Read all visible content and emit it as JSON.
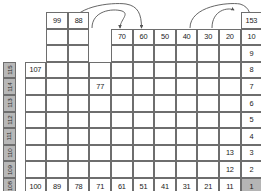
{
  "diagram": {
    "cell_w": 21.6,
    "cell_h": 16.6,
    "origin_x": 3,
    "origin_y": 12,
    "colors": {
      "grid_line": "#6e6e6e",
      "cell_fill": "#ffffff",
      "highlight_gray": "#b5b5b5",
      "highlight_black": "#151515",
      "side_label_fill": "#b8b8b8",
      "arrow": "#555555"
    }
  },
  "cells": [
    {
      "name": "cell-99",
      "col": 2,
      "row": 0,
      "text": "99",
      "fill": "white"
    },
    {
      "name": "cell-88",
      "col": 3,
      "row": 0,
      "text": "88",
      "fill": "white"
    },
    {
      "name": "cell-153",
      "col": 11,
      "row": 0,
      "text": "153",
      "fill": "white"
    },
    {
      "name": "cell-142",
      "col": 12,
      "row": 0,
      "text": "142",
      "fill": "white"
    },
    {
      "name": "cell-blank-c2r1",
      "col": 2,
      "row": 1,
      "text": "",
      "fill": "white"
    },
    {
      "name": "cell-blank-c3r1",
      "col": 3,
      "row": 1,
      "text": "",
      "fill": "white"
    },
    {
      "name": "cell-70",
      "col": 5,
      "row": 1,
      "text": "70",
      "fill": "white"
    },
    {
      "name": "cell-60",
      "col": 6,
      "row": 1,
      "text": "60",
      "fill": "white"
    },
    {
      "name": "cell-50",
      "col": 7,
      "row": 1,
      "text": "50",
      "fill": "white"
    },
    {
      "name": "cell-40",
      "col": 8,
      "row": 1,
      "text": "40",
      "fill": "white"
    },
    {
      "name": "cell-30",
      "col": 9,
      "row": 1,
      "text": "30",
      "fill": "white"
    },
    {
      "name": "cell-20",
      "col": 10,
      "row": 1,
      "text": "20",
      "fill": "white"
    },
    {
      "name": "cell-10",
      "col": 11,
      "row": 1,
      "text": "10",
      "fill": "white"
    },
    {
      "name": "cell-blank-c11r1",
      "col": 11,
      "row": 0,
      "text": "",
      "fill": "none"
    },
    {
      "name": "cell-blank-c12r1",
      "col": 12,
      "row": 1,
      "text": "",
      "fill": "white"
    },
    {
      "name": "cell-blank-c13r1",
      "col": 13,
      "row": 1,
      "text": "",
      "fill": "white"
    },
    {
      "name": "cell-blank-c2r2",
      "col": 2,
      "row": 2,
      "text": "",
      "fill": "white"
    },
    {
      "name": "cell-blank-c3r2",
      "col": 3,
      "row": 2,
      "text": "",
      "fill": "white"
    },
    {
      "name": "cell-blank-c5r2",
      "col": 5,
      "row": 2,
      "text": "",
      "fill": "white"
    },
    {
      "name": "cell-blank-c6r2",
      "col": 6,
      "row": 2,
      "text": "",
      "fill": "white"
    },
    {
      "name": "cell-blank-c7r2",
      "col": 7,
      "row": 2,
      "text": "",
      "fill": "white"
    },
    {
      "name": "cell-blank-c8r2",
      "col": 8,
      "row": 2,
      "text": "",
      "fill": "white"
    },
    {
      "name": "cell-blank-c9r2",
      "col": 9,
      "row": 2,
      "text": "",
      "fill": "white"
    },
    {
      "name": "cell-blank-c10r2",
      "col": 10,
      "row": 2,
      "text": "",
      "fill": "white"
    },
    {
      "name": "cell-9",
      "col": 11,
      "row": 2,
      "text": "9",
      "fill": "white"
    },
    {
      "name": "cell-blank-c12r2",
      "col": 12,
      "row": 2,
      "text": "",
      "fill": "white"
    },
    {
      "name": "cell-blank-c13r2",
      "col": 13,
      "row": 2,
      "text": "",
      "fill": "white"
    },
    {
      "name": "cell-107",
      "col": 1,
      "row": 3,
      "text": "107",
      "fill": "white"
    },
    {
      "name": "cell-8",
      "col": 11,
      "row": 3,
      "text": "8",
      "fill": "white"
    },
    {
      "name": "cell-131",
      "col": 14,
      "row": 3,
      "text": "131",
      "fill": "white"
    },
    {
      "name": "cell-77",
      "col": 4,
      "row": 4,
      "text": "77",
      "fill": "white"
    },
    {
      "name": "cell-7",
      "col": 11,
      "row": 4,
      "text": "7",
      "fill": "white"
    },
    {
      "name": "cell-black-c12r4",
      "col": 12,
      "row": 4,
      "text": "",
      "fill": "black"
    },
    {
      "name": "cell-6",
      "col": 11,
      "row": 5,
      "text": "6",
      "fill": "white"
    },
    {
      "name": "cell-159",
      "col": 12,
      "row": 5,
      "text": "159",
      "fill": "white"
    },
    {
      "name": "cell-5",
      "col": 11,
      "row": 6,
      "text": "5",
      "fill": "white"
    },
    {
      "name": "cell-158",
      "col": 12,
      "row": 6,
      "text": "158",
      "fill": "white"
    },
    {
      "name": "cell-4",
      "col": 11,
      "row": 7,
      "text": "4",
      "fill": "white"
    },
    {
      "name": "cell-157",
      "col": 12,
      "row": 7,
      "text": "157",
      "fill": "white"
    },
    {
      "name": "cell-13",
      "col": 10,
      "row": 8,
      "text": "13",
      "fill": "white"
    },
    {
      "name": "cell-3",
      "col": 11,
      "row": 8,
      "text": "3",
      "fill": "white"
    },
    {
      "name": "cell-156",
      "col": 12,
      "row": 8,
      "text": "156",
      "fill": "white"
    },
    {
      "name": "cell-12",
      "col": 10,
      "row": 9,
      "text": "12",
      "fill": "white"
    },
    {
      "name": "cell-2",
      "col": 11,
      "row": 9,
      "text": "2",
      "fill": "white"
    },
    {
      "name": "cell-155",
      "col": 12,
      "row": 9,
      "text": "155",
      "fill": "white"
    },
    {
      "name": "cell-144",
      "col": 13,
      "row": 9,
      "text": "144",
      "fill": "white"
    },
    {
      "name": "cell-133",
      "col": 14,
      "row": 9,
      "text": "133",
      "fill": "white"
    },
    {
      "name": "cell-125",
      "col": 15,
      "row": 9,
      "text": "125",
      "fill": "white"
    },
    {
      "name": "cell-100",
      "col": 1,
      "row": 10,
      "text": "100",
      "fill": "white"
    },
    {
      "name": "cell-89",
      "col": 2,
      "row": 10,
      "text": "89",
      "fill": "white"
    },
    {
      "name": "cell-78",
      "col": 3,
      "row": 10,
      "text": "78",
      "fill": "white"
    },
    {
      "name": "cell-71",
      "col": 4,
      "row": 10,
      "text": "71",
      "fill": "white"
    },
    {
      "name": "cell-61",
      "col": 5,
      "row": 10,
      "text": "61",
      "fill": "white"
    },
    {
      "name": "cell-51",
      "col": 6,
      "row": 10,
      "text": "51",
      "fill": "white"
    },
    {
      "name": "cell-41",
      "col": 7,
      "row": 10,
      "text": "41",
      "fill": "white"
    },
    {
      "name": "cell-31",
      "col": 8,
      "row": 10,
      "text": "31",
      "fill": "white"
    },
    {
      "name": "cell-21",
      "col": 9,
      "row": 10,
      "text": "21",
      "fill": "white"
    },
    {
      "name": "cell-11",
      "col": 10,
      "row": 10,
      "text": "11",
      "fill": "white"
    },
    {
      "name": "cell-1",
      "col": 11,
      "row": 10,
      "text": "1",
      "fill": "gray"
    },
    {
      "name": "cell-154",
      "col": 12,
      "row": 10,
      "text": "154",
      "fill": "white"
    },
    {
      "name": "cell-143",
      "col": 13,
      "row": 10,
      "text": "143",
      "fill": "white"
    },
    {
      "name": "cell-132",
      "col": 14,
      "row": 10,
      "text": "132",
      "fill": "white"
    },
    {
      "name": "cell-124",
      "col": 15,
      "row": 10,
      "text": "124",
      "fill": "white"
    }
  ],
  "blank_cells": [
    {
      "col": 1,
      "row": 4
    },
    {
      "col": 2,
      "row": 4
    },
    {
      "col": 3,
      "row": 4
    },
    {
      "col": 5,
      "row": 4
    },
    {
      "col": 6,
      "row": 4
    },
    {
      "col": 7,
      "row": 4
    },
    {
      "col": 8,
      "row": 4
    },
    {
      "col": 9,
      "row": 4
    },
    {
      "col": 10,
      "row": 4
    },
    {
      "col": 13,
      "row": 4
    },
    {
      "col": 14,
      "row": 4
    },
    {
      "col": 15,
      "row": 4
    },
    {
      "col": 1,
      "row": 3
    },
    {
      "col": 2,
      "row": 3
    },
    {
      "col": 3,
      "row": 3
    },
    {
      "col": 4,
      "row": 3
    },
    {
      "col": 5,
      "row": 3
    },
    {
      "col": 6,
      "row": 3
    },
    {
      "col": 7,
      "row": 3
    },
    {
      "col": 8,
      "row": 3
    },
    {
      "col": 9,
      "row": 3
    },
    {
      "col": 10,
      "row": 3
    },
    {
      "col": 12,
      "row": 3
    },
    {
      "col": 13,
      "row": 3
    },
    {
      "col": 15,
      "row": 3
    },
    {
      "col": 1,
      "row": 5
    },
    {
      "col": 2,
      "row": 5
    },
    {
      "col": 3,
      "row": 5
    },
    {
      "col": 4,
      "row": 5
    },
    {
      "col": 5,
      "row": 5
    },
    {
      "col": 6,
      "row": 5
    },
    {
      "col": 7,
      "row": 5
    },
    {
      "col": 8,
      "row": 5
    },
    {
      "col": 9,
      "row": 5
    },
    {
      "col": 10,
      "row": 5
    },
    {
      "col": 13,
      "row": 5
    },
    {
      "col": 14,
      "row": 5
    },
    {
      "col": 15,
      "row": 5
    },
    {
      "col": 1,
      "row": 6
    },
    {
      "col": 2,
      "row": 6
    },
    {
      "col": 3,
      "row": 6
    },
    {
      "col": 4,
      "row": 6
    },
    {
      "col": 5,
      "row": 6
    },
    {
      "col": 6,
      "row": 6
    },
    {
      "col": 7,
      "row": 6
    },
    {
      "col": 8,
      "row": 6
    },
    {
      "col": 9,
      "row": 6
    },
    {
      "col": 10,
      "row": 6
    },
    {
      "col": 13,
      "row": 6
    },
    {
      "col": 14,
      "row": 6
    },
    {
      "col": 15,
      "row": 6
    },
    {
      "col": 1,
      "row": 7
    },
    {
      "col": 2,
      "row": 7
    },
    {
      "col": 3,
      "row": 7
    },
    {
      "col": 4,
      "row": 7
    },
    {
      "col": 5,
      "row": 7
    },
    {
      "col": 6,
      "row": 7
    },
    {
      "col": 7,
      "row": 7
    },
    {
      "col": 8,
      "row": 7
    },
    {
      "col": 9,
      "row": 7
    },
    {
      "col": 10,
      "row": 7
    },
    {
      "col": 13,
      "row": 7
    },
    {
      "col": 14,
      "row": 7
    },
    {
      "col": 15,
      "row": 7
    },
    {
      "col": 1,
      "row": 8
    },
    {
      "col": 2,
      "row": 8
    },
    {
      "col": 3,
      "row": 8
    },
    {
      "col": 4,
      "row": 8
    },
    {
      "col": 5,
      "row": 8
    },
    {
      "col": 6,
      "row": 8
    },
    {
      "col": 7,
      "row": 8
    },
    {
      "col": 8,
      "row": 8
    },
    {
      "col": 9,
      "row": 8
    },
    {
      "col": 13,
      "row": 8
    },
    {
      "col": 14,
      "row": 8
    },
    {
      "col": 15,
      "row": 8
    },
    {
      "col": 1,
      "row": 9
    },
    {
      "col": 2,
      "row": 9
    },
    {
      "col": 3,
      "row": 9
    },
    {
      "col": 4,
      "row": 9
    },
    {
      "col": 5,
      "row": 9
    },
    {
      "col": 6,
      "row": 9
    },
    {
      "col": 7,
      "row": 9
    },
    {
      "col": 8,
      "row": 9
    },
    {
      "col": 9,
      "row": 9
    }
  ],
  "side_labels_left": [
    {
      "name": "side-label-115",
      "text": "115",
      "row": 3
    },
    {
      "name": "side-label-114",
      "text": "114",
      "row": 4
    },
    {
      "name": "side-label-113",
      "text": "113",
      "row": 5
    },
    {
      "name": "side-label-112",
      "text": "112",
      "row": 6
    },
    {
      "name": "side-label-111",
      "text": "111",
      "row": 7
    },
    {
      "name": "side-label-110",
      "text": "110",
      "row": 8
    },
    {
      "name": "side-label-109",
      "text": "109",
      "row": 9
    },
    {
      "name": "side-label-108",
      "text": "108",
      "row": 10
    }
  ],
  "side_labels_right": [
    {
      "name": "side-label-123",
      "text": "123",
      "row": 3
    },
    {
      "name": "side-label-122",
      "text": "122",
      "row": 4
    },
    {
      "name": "side-label-121",
      "text": "121",
      "row": 5
    },
    {
      "name": "side-label-120",
      "text": "120",
      "row": 6
    },
    {
      "name": "side-label-119",
      "text": "119",
      "row": 7
    },
    {
      "name": "side-label-118",
      "text": "118",
      "row": 8
    },
    {
      "name": "side-label-117",
      "text": "117",
      "row": 9
    },
    {
      "name": "side-label-116",
      "text": "116",
      "row": 10
    }
  ],
  "arrows": [
    {
      "name": "arrow-long-left",
      "d": "M 70.5 28 C 70.5 6, 112 2, 126 4 C 138 6, 141.5 14, 141.5 28"
    },
    {
      "name": "arrow-short-left",
      "d": "M 92 28 C 92 11, 112 8, 122 11 C 130 14, 120 20, 120 28"
    },
    {
      "name": "arrow-long-right",
      "d": "M 190 28 C 190 6, 228 2, 240 4 C 250 7, 251 15, 251 26"
    },
    {
      "name": "arrow-short-right",
      "d": "M 212 28 C 212 10, 228 7, 234 10"
    }
  ]
}
